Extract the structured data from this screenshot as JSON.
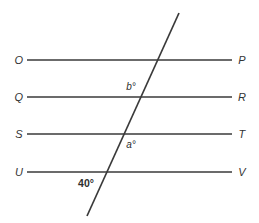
{
  "figure": {
    "background_color": "#ffffff",
    "line_color": "#3a3a3a",
    "label_color": "#333333",
    "width": 259,
    "height": 223
  },
  "parallel_lines": [
    {
      "id": "OP",
      "left_label": "O",
      "right_label": "P",
      "y": 60,
      "x1": 27,
      "x2": 232
    },
    {
      "id": "QR",
      "left_label": "Q",
      "right_label": "R",
      "y": 97,
      "x1": 27,
      "x2": 232
    },
    {
      "id": "ST",
      "left_label": "S",
      "right_label": "T",
      "y": 134,
      "x1": 27,
      "x2": 232
    },
    {
      "id": "UV",
      "left_label": "U",
      "right_label": "V",
      "y": 172,
      "x1": 27,
      "x2": 232
    }
  ],
  "transversal": {
    "id": "transversal",
    "x1": 179,
    "y1": 13,
    "x2": 87,
    "y2": 216
  },
  "angles": [
    {
      "id": "b",
      "text": "b°",
      "x": 131,
      "y": 87,
      "style": "italic"
    },
    {
      "id": "a",
      "text": "a°",
      "x": 131,
      "y": 145,
      "style": "italic"
    },
    {
      "id": "forty",
      "text": "40°",
      "x": 86,
      "y": 183,
      "style": "bold"
    }
  ],
  "point_labels": [
    {
      "id": "O",
      "text": "O",
      "x": 19,
      "y": 60
    },
    {
      "id": "P",
      "text": "P",
      "x": 242,
      "y": 60
    },
    {
      "id": "Q",
      "text": "Q",
      "x": 19,
      "y": 97
    },
    {
      "id": "R",
      "text": "R",
      "x": 242,
      "y": 97
    },
    {
      "id": "S",
      "text": "S",
      "x": 19,
      "y": 134
    },
    {
      "id": "T",
      "text": "T",
      "x": 242,
      "y": 134
    },
    {
      "id": "U",
      "text": "U",
      "x": 19,
      "y": 172
    },
    {
      "id": "V",
      "text": "V",
      "x": 242,
      "y": 172
    }
  ]
}
